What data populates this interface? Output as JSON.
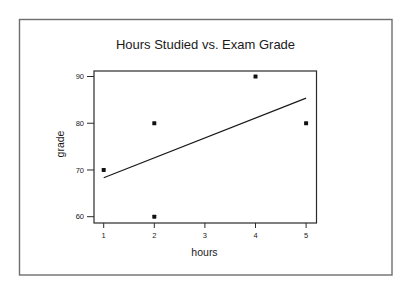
{
  "chart_data": {
    "type": "scatter",
    "title": "Hours Studied vs. Exam Grade",
    "xlabel": "hours",
    "ylabel": "grade",
    "x_ticks": [
      1,
      2,
      3,
      4,
      5
    ],
    "y_ticks": [
      60,
      70,
      80,
      90
    ],
    "xlim": [
      0.8,
      5.2
    ],
    "ylim": [
      58.7,
      91.3
    ],
    "grid": false,
    "legend": null,
    "series": [
      {
        "name": "observations",
        "type": "scatter",
        "x": [
          1,
          2,
          2,
          4,
          5
        ],
        "y": [
          70,
          80,
          60,
          90,
          80
        ]
      },
      {
        "name": "least-squares fit",
        "type": "line",
        "x": [
          1,
          5
        ],
        "y": [
          68.33,
          85.37
        ],
        "slope": 4.26,
        "intercept": 64.07
      }
    ]
  },
  "colors": {
    "outer_border": "#6e6e6e",
    "axis": "#2a2a2a",
    "points": "#111111",
    "fit_line": "#1a1a1a",
    "background": "#ffffff"
  }
}
